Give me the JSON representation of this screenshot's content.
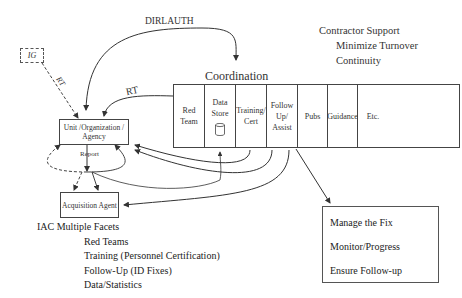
{
  "diagram": {
    "ig_box": {
      "label": "IG"
    },
    "edge_labels": {
      "ig_rt": "RT",
      "dirlauth": "DIRLAUTH",
      "rt": "RT",
      "report": "Report"
    },
    "unit_box": {
      "label": "Unit /Organization / Agency"
    },
    "acquisition_box": {
      "label": "Acquisition Agent"
    },
    "coordination": {
      "title": "Coordination",
      "cells": [
        {
          "label": "Red Team"
        },
        {
          "label": "Data Store",
          "icon": "database-cylinder-icon"
        },
        {
          "label": "Training/ Cert"
        },
        {
          "label": "Follow Up/ Assist"
        },
        {
          "label": "Pubs"
        },
        {
          "label": "Guidance"
        },
        {
          "label": "Etc."
        }
      ]
    },
    "contractor_support": {
      "title": "Contractor Support",
      "items": [
        "Minimize Turnover",
        "Continuity"
      ]
    },
    "fix_box": {
      "items": [
        "Manage the Fix",
        "Monitor/Progress",
        "Ensure Follow-up"
      ]
    },
    "iac_facets": {
      "title": "IAC Multiple Facets",
      "items": [
        "Red Teams",
        "Training (Personnel Certification)",
        "Follow-Up (ID Fixes)",
        "Data/Statistics"
      ]
    },
    "colors": {
      "line": "#333333",
      "background": "#ffffff"
    }
  }
}
